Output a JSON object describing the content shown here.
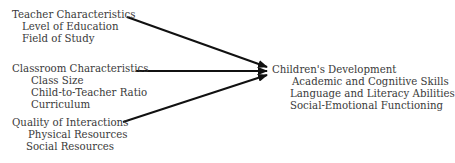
{
  "diagram": {
    "inputs": [
      {
        "title": "Teacher Characteristics",
        "items": [
          "Level of Education",
          "Field of Study"
        ]
      },
      {
        "title": "Classroom Characteristics",
        "items": [
          "Class Size",
          "Child-to-Teacher Ratio",
          "Curriculum"
        ]
      },
      {
        "title": "Quality of Interactions",
        "items": [
          "Physical Resources",
          "Social Resources"
        ]
      }
    ],
    "outcome": {
      "title": "Children's Development",
      "items": [
        "Academic and Cognitive Skills",
        "Language and Literacy Abilities",
        "Social-Emotional Functioning"
      ]
    },
    "arrow_color": "#111111",
    "text_color": "#3a3a3a"
  }
}
